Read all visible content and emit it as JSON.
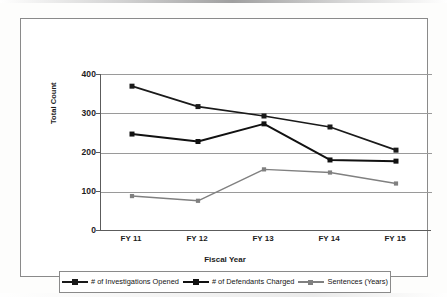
{
  "chart_data": {
    "type": "line",
    "title": "",
    "xlabel": "Fiscal Year",
    "ylabel": "Total Count",
    "categories": [
      "FY 11",
      "FY 12",
      "FY 13",
      "FY 14",
      "FY 15"
    ],
    "ylim": [
      0,
      400
    ],
    "yticks": [
      0,
      100,
      200,
      300,
      400
    ],
    "grid": true,
    "legend_position": "bottom",
    "series": [
      {
        "name": "# of Investigations Opened",
        "color": "#1a1a1a",
        "marker": "square",
        "values": [
          369,
          317,
          293,
          265,
          206
        ]
      },
      {
        "name": "# of Defendants Charged",
        "color": "#111111",
        "marker": "square",
        "values": [
          247,
          228,
          273,
          181,
          178
        ]
      },
      {
        "name": "Sentences (Years)",
        "color": "#808080",
        "marker": "square",
        "values": [
          89,
          77,
          157,
          149,
          121
        ]
      }
    ]
  },
  "axes": {
    "y_tick_labels": [
      "400",
      "300",
      "200",
      "100",
      "0"
    ],
    "y_axis_title": "Total Count",
    "x_tick_labels": [
      "FY 11",
      "FY 12",
      "FY 13",
      "FY 14",
      "FY 15"
    ],
    "x_axis_title": "Fiscal Year"
  },
  "legend": {
    "items": [
      {
        "label": "# of Investigations Opened",
        "color": "#1a1a1a"
      },
      {
        "label": "# of Defendants Charged",
        "color": "#111111"
      },
      {
        "label": "Sentences (Years)",
        "color": "#808080"
      }
    ]
  }
}
